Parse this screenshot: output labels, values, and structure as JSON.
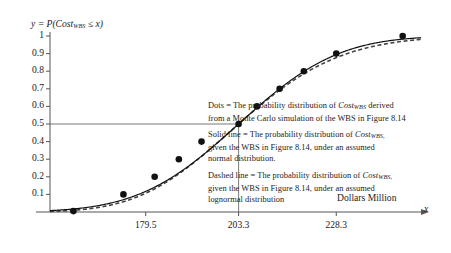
{
  "chart_data": {
    "type": "line",
    "title": "",
    "subtitle": "",
    "ylabel": "y = P(Cost_WBS ≤ x)",
    "xlabel": "Dollars Million",
    "x_axis_variable": "x",
    "xlim": [
      155.0,
      250.0
    ],
    "ylim": [
      0,
      1.04
    ],
    "grid": false,
    "legend_position": "inside-right",
    "x_ticks": [
      {
        "value": 179.5,
        "label": "179.5"
      },
      {
        "value": 203.3,
        "label": "203.3"
      },
      {
        "value": 228.3,
        "label": "228.3"
      }
    ],
    "y_ticks": [
      {
        "value": 0.1,
        "label": "0.1"
      },
      {
        "value": 0.2,
        "label": "0.2"
      },
      {
        "value": 0.3,
        "label": "0.3"
      },
      {
        "value": 0.4,
        "label": "0.4"
      },
      {
        "value": 0.5,
        "label": "0.5"
      },
      {
        "value": 0.6,
        "label": "0.6"
      },
      {
        "value": 0.7,
        "label": "0.7"
      },
      {
        "value": 0.8,
        "label": "0.8"
      },
      {
        "value": 0.9,
        "label": "0.9"
      },
      {
        "value": 1.0,
        "label": "1"
      }
    ],
    "reference_lines": [
      {
        "name": "median-horizontal",
        "orientation": "horizontal",
        "y": 0.5,
        "x_from": 155.0,
        "x_to": 203.3
      },
      {
        "name": "median-vertical",
        "orientation": "vertical",
        "x": 203.3,
        "y_from": 0.0,
        "y_to": 0.5
      }
    ],
    "series": [
      {
        "name": "Dots = Monte Carlo simulation",
        "style": "markers",
        "marker": "filled-circle",
        "color": "#111111",
        "points": [
          {
            "x": 161.0,
            "y": 0.005
          },
          {
            "x": 173.8,
            "y": 0.1
          },
          {
            "x": 181.8,
            "y": 0.2
          },
          {
            "x": 188.0,
            "y": 0.3
          },
          {
            "x": 193.8,
            "y": 0.4
          },
          {
            "x": 203.3,
            "y": 0.5
          },
          {
            "x": 208.0,
            "y": 0.6
          },
          {
            "x": 213.8,
            "y": 0.7
          },
          {
            "x": 220.0,
            "y": 0.8
          },
          {
            "x": 228.3,
            "y": 0.9
          },
          {
            "x": 245.3,
            "y": 1.0
          }
        ]
      },
      {
        "name": "Solid line = assumed normal distribution",
        "style": "solid-line",
        "color": "#111111",
        "distribution": "normal",
        "mean": 203.3,
        "sigma": 20.0
      },
      {
        "name": "Dashed line = assumed lognormal distribution",
        "style": "dashed-line",
        "color": "#555555",
        "distribution": "lognormal",
        "median": 203.3,
        "sigma": 0.1
      }
    ]
  },
  "legend": {
    "dots": {
      "line1_pre": "Dots = The probability distribution of ",
      "line1_var": "Cost",
      "line1_sub": "WBS",
      "line1_post": " derived",
      "line2": "from a Monte Carlo simulation of the WBS in Figure 8.14"
    },
    "solid": {
      "line1_pre": "Solid line = The probability distribution of ",
      "line1_var": "Cost",
      "line1_sub": "WBS,",
      "line2": "given the WBS in Figure 8.14, under an assumed",
      "line3": "normal distribution."
    },
    "dashed": {
      "line1_pre": "Dashed line = The probability distribution of ",
      "line1_var": "Cost",
      "line1_sub": "WBS,",
      "line2": "given the WBS in Figure 8.14, under an assumed",
      "line3": "lognormal distribution"
    }
  },
  "axis_titles": {
    "y_pre": "y = P(",
    "y_var": "Cost",
    "y_sub": "WBS",
    "y_post": " ≤ x)",
    "x_caption": "Dollars Million",
    "x_variable": "x"
  },
  "colors": {
    "background": "#ffffff",
    "ink": "#1b1b1b",
    "axis": "#555555",
    "marker": "#111111",
    "solid_curve": "#111111",
    "dashed_curve": "#444444"
  }
}
